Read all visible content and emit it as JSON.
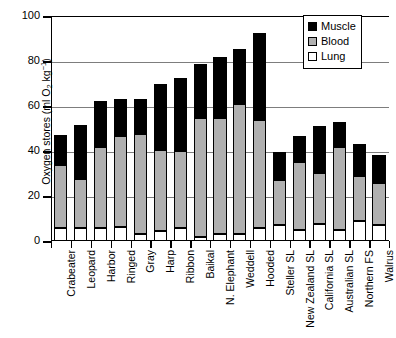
{
  "chart_data": {
    "type": "bar",
    "stacked": true,
    "title": "",
    "xlabel": "",
    "ylabel": "Oxygen stores (ml O2 kg-1)",
    "ylabel_parts": {
      "prefix": "Oxygen stores (ml O",
      "sub": "2",
      "mid": " kg",
      "sup": "−1",
      "suffix": ")"
    },
    "ylim": [
      0,
      100
    ],
    "yticks": [
      0,
      20,
      40,
      60,
      80,
      100
    ],
    "ytick_labels": [
      "0",
      "20",
      "40",
      "60",
      "80",
      "100"
    ],
    "grid": "horizontal",
    "legend_position": "top-right",
    "categories": [
      "Crabeater",
      "Leopard",
      "Harbor",
      "Ringed",
      "Gray",
      "Harp",
      "Ribbon",
      "Baikal",
      "N. Elephant",
      "Weddell",
      "Hooded",
      "Steller SL",
      "New Zealand SL",
      "California SL",
      "Australian SL",
      "Northern FS",
      "Walrus"
    ],
    "series": [
      {
        "name": "Lung",
        "color": "#ffffff",
        "values": [
          5.8,
          5.7,
          5.7,
          6.4,
          3.3,
          4.4,
          5.8,
          2.0,
          3.3,
          3.3,
          5.9,
          7.3,
          5.0,
          7.6,
          4.7,
          8.7,
          7.3
        ]
      },
      {
        "name": "Blood",
        "color": "#b0b0b0",
        "values": [
          28.1,
          21.7,
          36.1,
          40.4,
          44.3,
          36.0,
          34.2,
          52.7,
          51.2,
          57.8,
          48.1,
          19.9,
          30.0,
          22.8,
          37.0,
          20.1,
          18.3
        ]
      },
      {
        "name": "Muscle",
        "color": "#000000",
        "values": [
          13.3,
          24.0,
          20.5,
          16.4,
          15.4,
          29.6,
          32.5,
          23.9,
          27.1,
          24.3,
          38.4,
          12.3,
          11.8,
          20.7,
          11.3,
          14.2,
          12.5
        ]
      }
    ],
    "totals": [
      47.2,
      51.4,
      62.3,
      63.2,
      63.0,
      70.0,
      72.5,
      78.6,
      81.6,
      85.4,
      92.4,
      39.5,
      46.8,
      51.1,
      53.0,
      43.0,
      38.1
    ]
  },
  "legend": {
    "items": [
      {
        "label": "Muscle",
        "swatch": "muscle-swatch"
      },
      {
        "label": "Blood",
        "swatch": "blood-swatch"
      },
      {
        "label": "Lung",
        "swatch": "lung-swatch"
      }
    ]
  }
}
